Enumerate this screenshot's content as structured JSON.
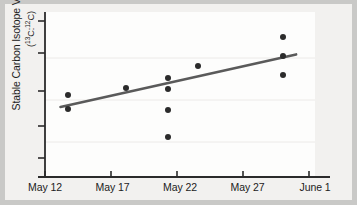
{
  "chart_data": {
    "type": "scatter",
    "title": "",
    "subtitle": "",
    "xlabel": "",
    "ylabel": "Stable Carbon Isotope Values Ratio",
    "ylabel_sub": "(13C:12C)",
    "ylabel_sub_display": "(¹³C:¹²C)",
    "grid": false,
    "legend": "none",
    "x_tick_labels": [
      "May 12",
      "May 17",
      "May 22",
      "May 27",
      "June 1"
    ],
    "x_tick_values": [
      0,
      5,
      10,
      15,
      20
    ],
    "xlim": [
      0,
      20
    ],
    "y_tick_labels": [
      "",
      "",
      "",
      "",
      ""
    ],
    "y_tick_values": [
      0,
      1,
      2,
      3,
      4
    ],
    "ylim": [
      -0.25,
      4.3
    ],
    "y_axis_labeled": false,
    "series": [
      {
        "name": "Stable carbon isotope ratio samples",
        "marker": "filled-circle",
        "color": "#2b2b2b",
        "points": [
          {
            "label": "May 13.7",
            "x": 1.7,
            "y": 2.02
          },
          {
            "label": "May 13.7",
            "x": 1.7,
            "y": 1.63
          },
          {
            "label": "May 18",
            "x": 6.0,
            "y": 2.21
          },
          {
            "label": "May 21",
            "x": 9.1,
            "y": 2.48
          },
          {
            "label": "May 21",
            "x": 9.1,
            "y": 2.18
          },
          {
            "label": "May 21",
            "x": 9.1,
            "y": 1.6
          },
          {
            "label": "May 21",
            "x": 9.1,
            "y": 0.85
          },
          {
            "label": "May 23",
            "x": 11.3,
            "y": 2.81
          },
          {
            "label": "May 29.5",
            "x": 17.6,
            "y": 3.62
          },
          {
            "label": "May 29.5",
            "x": 17.6,
            "y": 3.08
          },
          {
            "label": "May 29.5",
            "x": 17.6,
            "y": 2.57
          }
        ]
      }
    ],
    "trendline": {
      "name": "linear regression fit",
      "color": "#5a5a5a",
      "x_start": 1.15,
      "y_start": 1.68,
      "x_end": 18.6,
      "y_end": 3.13
    },
    "axis_color": "#2b2b2b",
    "background_color": "#f2f1ef",
    "figure_background_color": "#c9c9c7"
  },
  "figure": {
    "alt": "Scatter plot of stable carbon isotope values ratio versus date from May 12 to June 1 with an upward linear trend line"
  }
}
